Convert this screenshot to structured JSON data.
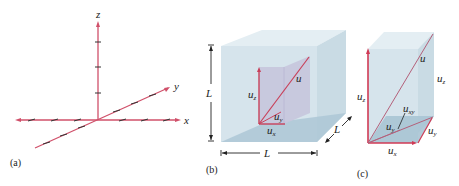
{
  "figure": {
    "colors": {
      "axis": "#d0506a",
      "vector": "#c8405a",
      "tick": "#333333",
      "box_front": "#d3e2ea",
      "box_top": "#e4eef3",
      "box_side": "#c5d8e2",
      "box_floor": "#a9c4d4",
      "inner_box": "#c7c5dd",
      "text": "#222222"
    },
    "panel_a": {
      "caption": "(a)",
      "axes": {
        "x": "x",
        "y": "y",
        "z": "z"
      }
    },
    "panel_b": {
      "caption": "(b)",
      "dimension_vertical": "L",
      "dimension_horizontal": "L",
      "dimension_depth": "L",
      "vector_label": "u",
      "component_z": {
        "base": "u",
        "sub": "z"
      },
      "component_y": {
        "base": "u",
        "sub": "y"
      },
      "component_x": {
        "base": "u",
        "sub": "x"
      }
    },
    "panel_c": {
      "caption": "(c)",
      "vector_label": "u",
      "component_z_left": {
        "base": "u",
        "sub": "z"
      },
      "component_z_right": {
        "base": "u",
        "sub": "z"
      },
      "component_xy": {
        "base": "u",
        "sub": "xy"
      },
      "component_y_inner": {
        "base": "u",
        "sub": "y"
      },
      "component_y": {
        "base": "u",
        "sub": "y"
      },
      "component_x": {
        "base": "u",
        "sub": "x"
      }
    }
  }
}
